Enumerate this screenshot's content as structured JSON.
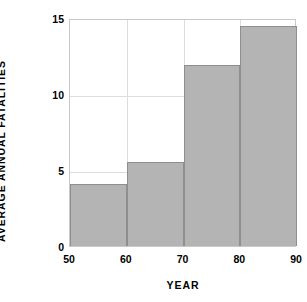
{
  "chart_data": {
    "type": "bar",
    "title": "",
    "xlabel": "YEAR",
    "ylabel": "AVERAGE ANNUAL FATALITIES",
    "categories": [
      "50",
      "60",
      "70",
      "80"
    ],
    "bin_edges": [
      50,
      60,
      70,
      80,
      90
    ],
    "values": [
      4.1,
      5.5,
      11.9,
      14.5
    ],
    "xlim": [
      50,
      90
    ],
    "ylim": [
      0,
      15
    ],
    "xticks": [
      "50",
      "60",
      "70",
      "80",
      "90"
    ],
    "xtick_values": [
      50,
      60,
      70,
      80,
      90
    ],
    "yticks": [
      "0",
      "5",
      "10",
      "15"
    ],
    "ytick_values": [
      0,
      5,
      10,
      15
    ],
    "grid": true,
    "legend": "none",
    "bar_color": "#b4b4b4",
    "bar_edge_color": "#8e8e8e",
    "grid_color": "#dddddd",
    "axes_color": "#c9c9c9",
    "background": "#ffffff"
  }
}
